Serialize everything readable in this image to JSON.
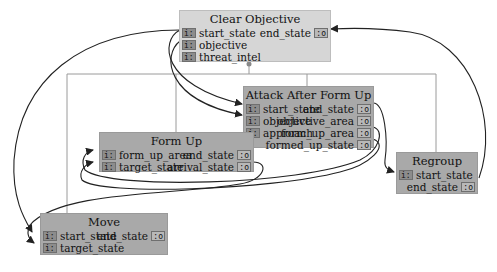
{
  "diagram": {
    "nodes": {
      "clear_objective": {
        "title": "Clear Objective",
        "inputs": [
          "start_state",
          "objective",
          "threat_intel"
        ],
        "outputs": [
          "end_state"
        ],
        "in_tag": "i:",
        "out_tag": ":o"
      },
      "attack_after_form_up": {
        "title": "Attack After Form Up",
        "inputs": [
          "start_state",
          "objective",
          "approach"
        ],
        "outputs": [
          "end_state",
          "objective_area",
          "form_up_area",
          "formed_up_state"
        ],
        "in_tag": "i:",
        "out_tag": ":o"
      },
      "form_up": {
        "title": "Form Up",
        "inputs": [
          "form_up_area",
          "target_state"
        ],
        "outputs": [
          "end_state",
          "arrival_state"
        ],
        "in_tag": "i:",
        "out_tag": ":o"
      },
      "regroup": {
        "title": "Regroup",
        "inputs": [
          "start_state"
        ],
        "outputs": [
          "end_state"
        ],
        "in_tag": "i:",
        "out_tag": ":o"
      },
      "move": {
        "title": "Move",
        "inputs": [
          "start_state",
          "target_state"
        ],
        "outputs": [
          "end_state"
        ],
        "in_tag": "i:",
        "out_tag": ":o"
      }
    },
    "colors": {
      "parent_node": "#d6d6d6",
      "child_node": "#a9a9a9",
      "port": "#8c8c8c",
      "wire": "#222222",
      "hierarchy_line": "#9a9a9a"
    }
  }
}
